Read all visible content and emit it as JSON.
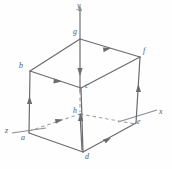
{
  "figure": {
    "kind": "geometry-diagram",
    "width": 172,
    "height": 169,
    "background_color": "#fefefe",
    "stroke_color": "#6b6b70",
    "hidden_stroke_color": "#9a9aa0",
    "label_color": "#56565a"
  },
  "axes": [
    {
      "id": "axis-y",
      "label": "y",
      "x": 77,
      "y": 2
    },
    {
      "id": "axis-x",
      "label": "x",
      "x": 159,
      "y": 108
    },
    {
      "id": "axis-z",
      "label": "z",
      "x": 5,
      "y": 127
    }
  ],
  "vertices": [
    {
      "id": "vertex-g",
      "label": "g",
      "x": 73,
      "y": 28
    },
    {
      "id": "vertex-f",
      "label": "f",
      "x": 143,
      "y": 47
    },
    {
      "id": "vertex-b",
      "label": "b",
      "x": 19,
      "y": 62
    },
    {
      "id": "vertex-c",
      "label": "c",
      "x": 85,
      "y": 82
    },
    {
      "id": "vertex-h",
      "label": "h",
      "x": 73,
      "y": 107
    },
    {
      "id": "vertex-e",
      "label": "e",
      "x": 137,
      "y": 118
    },
    {
      "id": "vertex-a",
      "label": "a",
      "x": 21,
      "y": 134
    },
    {
      "id": "vertex-d",
      "label": "d",
      "x": 85,
      "y": 153
    }
  ],
  "edges": [
    {
      "id": "edge-g-f",
      "from": "g",
      "to": "f",
      "hidden": false,
      "arrow": true
    },
    {
      "id": "edge-b-g",
      "from": "b",
      "to": "g",
      "hidden": false,
      "arrow": false
    },
    {
      "id": "edge-b-c",
      "from": "b",
      "to": "c",
      "hidden": false,
      "arrow": true
    },
    {
      "id": "edge-c-f",
      "from": "c",
      "to": "f",
      "hidden": false,
      "arrow": false
    },
    {
      "id": "edge-g-h",
      "from": "g",
      "to": "h",
      "hidden": true,
      "arrow": true
    },
    {
      "id": "edge-b-a",
      "from": "b",
      "to": "a",
      "hidden": false,
      "arrow": true
    },
    {
      "id": "edge-f-e",
      "from": "f",
      "to": "e",
      "hidden": false,
      "arrow": true
    },
    {
      "id": "edge-c-d",
      "from": "c",
      "to": "d",
      "hidden": false,
      "arrow": false
    },
    {
      "id": "edge-a-h",
      "from": "a",
      "to": "h",
      "hidden": true,
      "arrow": true
    },
    {
      "id": "edge-h-e",
      "from": "h",
      "to": "e",
      "hidden": true,
      "arrow": false
    },
    {
      "id": "edge-a-d",
      "from": "a",
      "to": "d",
      "hidden": false,
      "arrow": false
    },
    {
      "id": "edge-d-e",
      "from": "d",
      "to": "e",
      "hidden": false,
      "arrow": true
    },
    {
      "id": "edge-d-h",
      "from": "d",
      "to": "h",
      "hidden": false,
      "arrow": true
    }
  ]
}
